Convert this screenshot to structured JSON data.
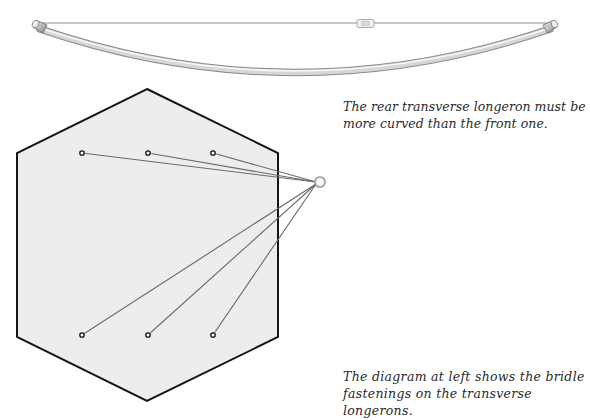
{
  "figure": {
    "longeron_illustration": {
      "description": "Curved rear transverse longeron with tensioning line and turnbuckle",
      "tube_color": "#c8c8c8",
      "tube_highlight": "#f2f2f2",
      "line_color": "#8a8a8a"
    },
    "bridle_diagram": {
      "hexagon_fill": "#ececec",
      "hexagon_stroke": "#111111",
      "line_color": "#6e6e6e",
      "fastening_points_top": 3,
      "fastening_points_bottom": 3,
      "ring_icon": "bridle-ring"
    }
  },
  "captions": {
    "longeron_note": "The rear transverse longeron must be more curved than the front one.",
    "bridle_note": "The diagram at left shows the bridle fastenings on the transverse longerons."
  }
}
